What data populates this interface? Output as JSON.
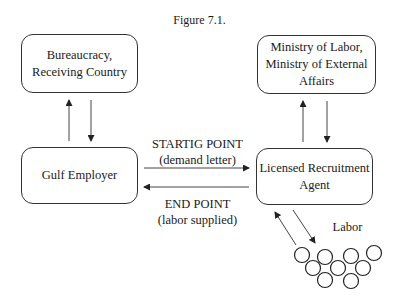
{
  "figure": {
    "title": "Figure 7.1."
  },
  "nodes": {
    "bureaucracy": {
      "line1": "Bureaucracy,",
      "line2": "Receiving Country"
    },
    "ministry": {
      "line1": "Ministry of Labor,",
      "line2": "Ministry of External",
      "line3": "Affairs"
    },
    "employer": {
      "line1": "Gulf Employer"
    },
    "agent": {
      "line1": "Licensed Recruitment",
      "line2": "Agent"
    }
  },
  "edges": {
    "start": {
      "line1": "STARTIG POINT",
      "line2": "(demand letter)"
    },
    "end": {
      "line1": "END POINT",
      "line2": "(labor supplied)"
    },
    "labor": {
      "label": "Labor"
    }
  },
  "colors": {
    "stroke": "#333333",
    "text": "#1a1a1a",
    "background": "#ffffff"
  }
}
